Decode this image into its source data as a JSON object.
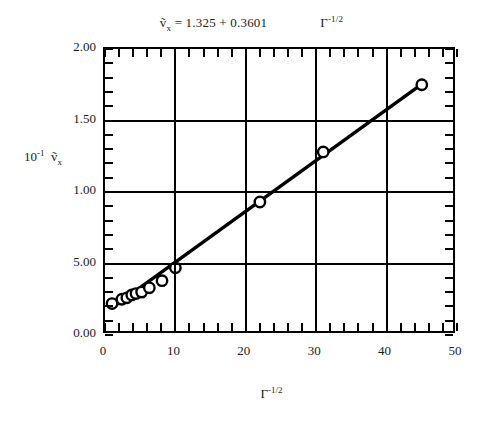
{
  "figure": {
    "title_equation": "ṽ_x = 1.325 + 0.3601  Γ^-1/2",
    "title_lhs": "ṽ",
    "title_lhs_sub": "x",
    "title_rhs": "= 1.325 + 0.3601",
    "title_gamma": "Γ",
    "title_gamma_exp": "-1/2",
    "y_axis_title_base": "10",
    "y_axis_title_exp": "-1",
    "y_axis_title_var": "ṽ",
    "y_axis_title_var_sub": "x",
    "x_axis_title": "Γ",
    "x_axis_title_exp": "-1/2"
  },
  "chart_data": {
    "type": "scatter",
    "xlabel": "Γ^-1/2",
    "ylabel": "10^-1 ṽx",
    "xlim": [
      0,
      50
    ],
    "ylim": [
      0.0,
      2.0
    ],
    "grid": true,
    "legend": "none",
    "x_ticklabels": [
      "0",
      "10",
      "20",
      "30",
      "40",
      "50"
    ],
    "x_tickvalues": [
      0,
      10,
      20,
      30,
      40,
      50
    ],
    "y_ticklabels": [
      "0.00",
      "5.00",
      "1.00",
      "1.50",
      "2.00"
    ],
    "y_tickvalues": [
      0.0,
      0.5,
      1.0,
      1.5,
      2.0
    ],
    "x_minor_per_major": 5,
    "y_minor_per_major": 5,
    "marker": "open-circle",
    "series": [
      {
        "name": "measured points",
        "x": [
          1.0,
          2.4,
          3.1,
          3.8,
          4.4,
          5.2,
          6.3,
          8.1,
          10.0,
          22.0,
          31.0,
          45.0
        ],
        "y": [
          0.22,
          0.25,
          0.26,
          0.28,
          0.29,
          0.3,
          0.33,
          0.38,
          0.47,
          0.93,
          1.28,
          1.75
        ]
      }
    ],
    "fit_line": {
      "name": "linear fit",
      "intercept": 0.1325,
      "slope": 0.03601,
      "equation": "ṽx = 1.325 + 0.3601 Γ^-1/2",
      "x_start": 1.0,
      "x_end": 45.0,
      "y_start": 0.19,
      "y_end": 1.755
    }
  },
  "axis_labels": {
    "y": [
      "2.00",
      "1.50",
      "1.00",
      "5.00",
      "0.00"
    ],
    "x": [
      "0",
      "10",
      "20",
      "30",
      "40",
      "50"
    ]
  }
}
